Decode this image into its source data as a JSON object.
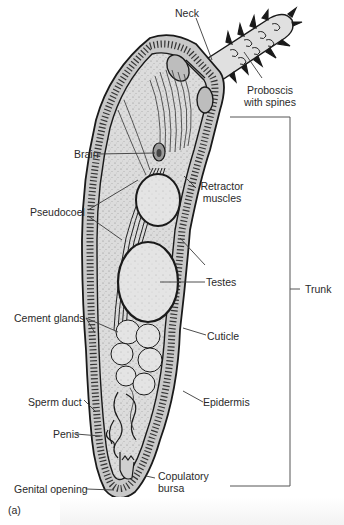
{
  "figure": {
    "panel_label": "(a)",
    "colors": {
      "outline": "#1a1a1a",
      "body_fill": "#d9d9d9",
      "organ_fill": "#e6e6e6",
      "label_text": "#2a2a2a",
      "leader_line": "#3a3a3a"
    }
  },
  "labels": {
    "neck": "Neck",
    "proboscis_line1": "Proboscis",
    "proboscis_line2": "with spines",
    "brain": "Brain",
    "retractor_line1": "Retractor",
    "retractor_line2": "muscles",
    "pseudocoel": "Pseudocoel",
    "testes": "Testes",
    "trunk": "Trunk",
    "cement_glands": "Cement glands",
    "cuticle": "Cuticle",
    "sperm_duct": "Sperm duct",
    "epidermis": "Epidermis",
    "penis": "Penis",
    "copulatory_line1": "Copulatory",
    "copulatory_line2": "bursa",
    "genital_opening": "Genital opening"
  }
}
